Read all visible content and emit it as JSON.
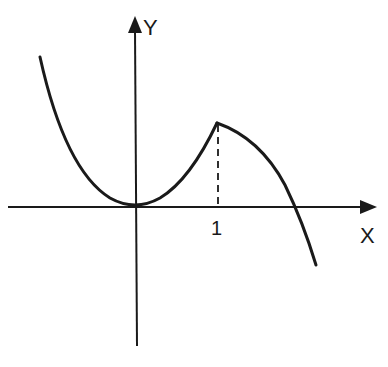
{
  "diagram": {
    "type": "function-graph",
    "axes": {
      "x_label": "X",
      "y_label": "Y"
    },
    "ticks": [
      {
        "label": "1",
        "x_value": 1
      }
    ],
    "curve": {
      "description": "Parabola-like curve with minimum at origin rising to a cusp peak at x=1, then decreasing concave-down and crossing the x-axis beyond x=1",
      "points": [
        {
          "name": "minimum",
          "x": 0,
          "y": 0
        },
        {
          "name": "peak",
          "x": 1
        }
      ]
    },
    "guide_lines": [
      {
        "style": "dashed",
        "from": "peak",
        "to": "x-axis at 1"
      }
    ],
    "colors": {
      "stroke": "#1a1a1a",
      "background": "#ffffff"
    }
  }
}
